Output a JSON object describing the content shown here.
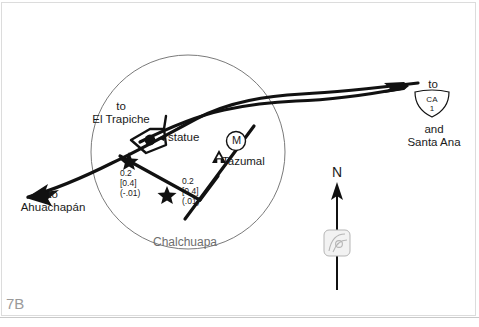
{
  "figure": {
    "plate_number": "7B",
    "place_name": "Chalchuapa"
  },
  "map": {
    "destinations": {
      "el_trapiche": "to\nEl Trapiche",
      "ahuachapan": "to\nAhuachapán",
      "ca1_prefix": "to",
      "ca1_suffix": "and\nSanta Ana"
    },
    "route_shield": {
      "state": "CA",
      "number": "1"
    },
    "points_of_interest": {
      "statue": "statue",
      "tazumal": "Tazumal",
      "museum_symbol": "M"
    },
    "distances": {
      "left_segment": "0.2\n[0.4]\n(-.01)",
      "right_segment": "0.2\n[0.4]\n(.01)"
    },
    "compass": {
      "north": "N"
    }
  },
  "colors": {
    "ink": "#1a1a1a",
    "road": "#111111",
    "circle_outline": "#6b6b6b",
    "muted_text": "#6e6e6e",
    "plate_text": "#9a9a9a",
    "frame": "#dcdcdc",
    "compass_emblem": "#b5b5b5"
  }
}
